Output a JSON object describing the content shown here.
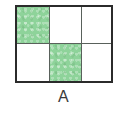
{
  "figure": {
    "label": "A",
    "shape": "rectangle-grid",
    "columns": 3,
    "rows": 2,
    "total_cells": 6,
    "shaded_cells": 2,
    "unshaded_cells": 4,
    "fraction_shaded": "2/6",
    "colors": {
      "shaded_fill": "#8ed39a",
      "unshaded_fill": "#ffffff",
      "outer_border": "#2b2b2b",
      "inner_divider": "#59615b",
      "label_text": "#3a3a3a",
      "background": "#ffffff"
    },
    "cells": [
      {
        "row": 0,
        "col": 0,
        "shaded": true
      },
      {
        "row": 0,
        "col": 1,
        "shaded": false
      },
      {
        "row": 0,
        "col": 2,
        "shaded": false
      },
      {
        "row": 1,
        "col": 0,
        "shaded": false
      },
      {
        "row": 1,
        "col": 1,
        "shaded": true
      },
      {
        "row": 1,
        "col": 2,
        "shaded": false
      }
    ]
  }
}
